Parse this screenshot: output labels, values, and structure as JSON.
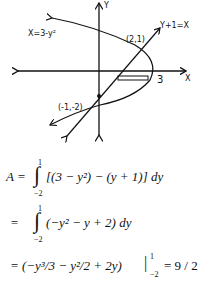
{
  "graph": {
    "labels": {
      "y_axis": "Y",
      "x_axis": "X",
      "parabola": "X=3-y²",
      "line": "Y+1=X",
      "point_upper": "(2,1)",
      "point_lower": "(-1,-2)",
      "x_intercept": "3"
    }
  },
  "equations": [
    {
      "prefix": "A =",
      "integral_upper": "1",
      "integral_lower": "−2",
      "body": "[(3 − y²) − (y + 1)] dy"
    },
    {
      "prefix": "=",
      "integral_upper": "1",
      "integral_lower": "−2",
      "body": "(−y² − y + 2) dy"
    },
    {
      "prefix": "=",
      "body": "(−y³/3 − y²/2 + 2y)",
      "eval_upper": "1",
      "eval_lower": "−2",
      "result": "= 9 / 2"
    }
  ]
}
